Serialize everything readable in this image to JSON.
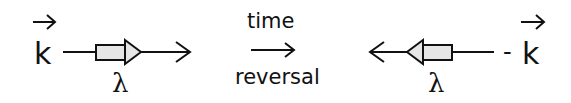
{
  "diagram": {
    "type": "time-reversal-illustration",
    "colors": {
      "stroke": "#111111",
      "box_fill": "#e6e6e6",
      "background": "#ffffff"
    },
    "left": {
      "vector_label": "k",
      "vector_overarrow": "→",
      "wavelength_label": "λ",
      "direction": "right"
    },
    "middle": {
      "top_label": "time",
      "arrow": "→",
      "bottom_label": "reversal"
    },
    "right": {
      "sign": "-",
      "vector_label": "k",
      "vector_overarrow": "→",
      "wavelength_label": "λ",
      "direction": "left"
    }
  }
}
